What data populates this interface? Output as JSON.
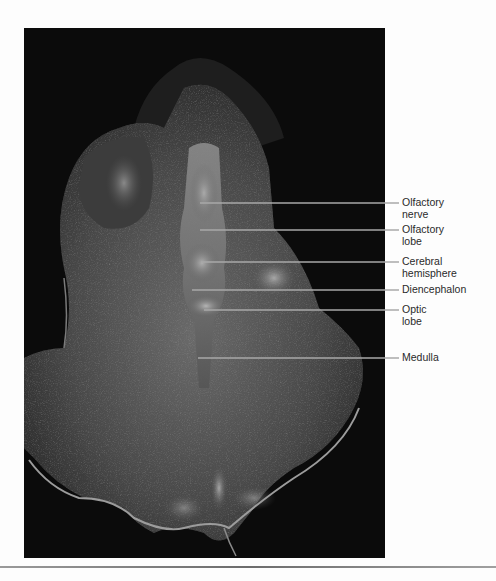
{
  "figure": {
    "colors": {
      "background": "#fdfdfd",
      "photo_background": "#0b0b0b",
      "leader_line": "#a8a8a8",
      "label_text": "#2a2a2a",
      "rule": "#7a7a7a"
    },
    "labels": [
      {
        "id": "olfactory-nerve",
        "text": "Olfactory\nnerve"
      },
      {
        "id": "olfactory-lobe",
        "text": "Olfactory\nlobe"
      },
      {
        "id": "cerebral-hemisphere",
        "text": "Cerebral\nhemisphere"
      },
      {
        "id": "diencephalon",
        "text": "Diencephalon"
      },
      {
        "id": "optic-lobe",
        "text": "Optic\nlobe"
      },
      {
        "id": "medulla",
        "text": "Medulla"
      }
    ]
  }
}
